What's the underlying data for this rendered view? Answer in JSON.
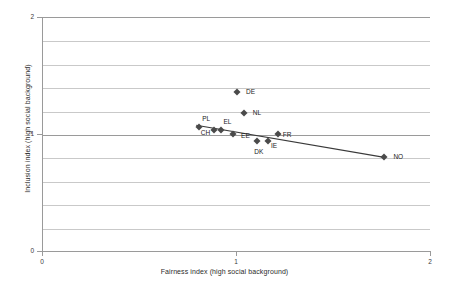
{
  "chart_data": {
    "type": "scatter",
    "title": "",
    "xlabel": "Fairness index (high social background)",
    "ylabel": "Inclusion index (high social background)",
    "xlim": [
      0,
      2
    ],
    "ylim": [
      0,
      2
    ],
    "xticks": [
      "0",
      "1",
      "2"
    ],
    "yticks": [
      "0",
      "1",
      "2"
    ],
    "grid": true,
    "grid_interval": 0.2,
    "legend": "none",
    "points": [
      {
        "label": "DE",
        "x": 1.005,
        "y": 1.36,
        "label_dx": 9,
        "label_dy": 0
      },
      {
        "label": "NL",
        "x": 1.04,
        "y": 1.18,
        "label_dx": 9,
        "label_dy": 0
      },
      {
        "label": "PL",
        "x": 0.81,
        "y": 1.06,
        "label_dx": 3,
        "label_dy": -8
      },
      {
        "label": "CH",
        "x": 0.885,
        "y": 1.03,
        "label_dx": -13,
        "label_dy": 3
      },
      {
        "label": "EL",
        "x": 0.925,
        "y": 1.035,
        "label_dx": 2,
        "label_dy": -8
      },
      {
        "label": "EE",
        "x": 0.985,
        "y": 1.0,
        "label_dx": 8,
        "label_dy": 2
      },
      {
        "label": "DK",
        "x": 1.11,
        "y": 0.94,
        "label_dx": -3,
        "label_dy": 11
      },
      {
        "label": "IE",
        "x": 1.165,
        "y": 0.94,
        "label_dx": 3,
        "label_dy": 5
      },
      {
        "label": "FR",
        "x": 1.215,
        "y": 1.0,
        "label_dx": 5,
        "label_dy": 1
      },
      {
        "label": "NO",
        "x": 1.765,
        "y": 0.8,
        "label_dx": 9,
        "label_dy": 0
      }
    ],
    "trendline": {
      "x0": 0.795,
      "y0": 1.075,
      "x1": 1.765,
      "y1": 0.8
    },
    "marker_color": "#4a4a4a",
    "trendline_color": "#3a3a3a",
    "gridline_color": "#c9c9c9",
    "axis_color": "#9a9a9a"
  }
}
